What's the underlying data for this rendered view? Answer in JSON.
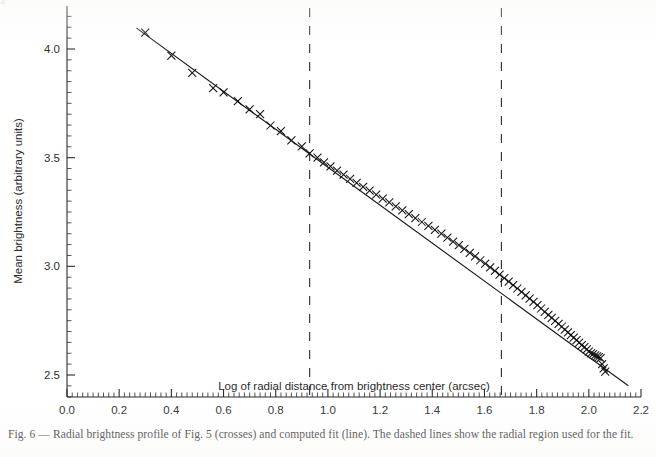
{
  "figure": {
    "clipped_top_text": "3",
    "caption": "Fig. 6 — Radial brightness profile of Fig. 5 (crosses) and computed fit (line). The dashed lines show the radial region used for the fit.",
    "caption_label": "Fig. 6",
    "colors": {
      "ink": "#1a1a1a",
      "axis": "#2b2b2b",
      "marker": "#111111",
      "fit_line": "#1a1a1a",
      "dashed_guide": "#333333",
      "background": "#ffffff"
    }
  },
  "chart_data": {
    "type": "scatter",
    "title": "",
    "xlabel": "Log of radial distance from brightness center (arcsec)",
    "ylabel": "Mean brightness (arbitrary units)",
    "xlim": [
      0.0,
      2.2
    ],
    "ylim": [
      2.4,
      4.15
    ],
    "xticks": [
      0.0,
      0.2,
      0.4,
      0.6,
      0.8,
      1.0,
      1.2,
      1.4,
      1.6,
      1.8,
      2.0,
      2.2
    ],
    "xtick_labels": [
      "0.0",
      "0.2",
      "0.4",
      "0.6",
      "0.8",
      "1.0",
      "1.2",
      "1.4",
      "1.6",
      "1.8",
      "2.0",
      "2.2"
    ],
    "x_minor_step": 0.02,
    "yticks": [
      2.5,
      3.0,
      3.5,
      4.0
    ],
    "ytick_labels": [
      "2.5",
      "3.0",
      "3.5",
      "4.0"
    ],
    "y_minor_step": 0.05,
    "grid": false,
    "legend": "none",
    "series": [
      {
        "name": "Radial brightness profile (crosses)",
        "marker": "x",
        "x": [
          0.3,
          0.4,
          0.48,
          0.56,
          0.6,
          0.655,
          0.7,
          0.74,
          0.78,
          0.82,
          0.86,
          0.9,
          0.93,
          0.96,
          0.985,
          1.01,
          1.035,
          1.06,
          1.085,
          1.11,
          1.135,
          1.16,
          1.185,
          1.21,
          1.235,
          1.26,
          1.285,
          1.31,
          1.335,
          1.36,
          1.385,
          1.41,
          1.435,
          1.458,
          1.48,
          1.502,
          1.523,
          1.544,
          1.564,
          1.584,
          1.603,
          1.622,
          1.64,
          1.658,
          1.676,
          1.693,
          1.71,
          1.726,
          1.742,
          1.758,
          1.773,
          1.788,
          1.803,
          1.817,
          1.831,
          1.845,
          1.858,
          1.871,
          1.884,
          1.896,
          1.908,
          1.92,
          1.931,
          1.942,
          1.953,
          1.963,
          1.973,
          1.983,
          1.992,
          2.0,
          2.008,
          2.016,
          2.024,
          2.031,
          2.038,
          2.045,
          2.051,
          2.057,
          2.063
        ],
        "y": [
          4.075,
          3.97,
          3.89,
          3.82,
          3.8,
          3.76,
          3.722,
          3.7,
          3.648,
          3.622,
          3.58,
          3.552,
          3.52,
          3.5,
          3.478,
          3.46,
          3.44,
          3.422,
          3.402,
          3.384,
          3.366,
          3.348,
          3.33,
          3.312,
          3.294,
          3.276,
          3.258,
          3.24,
          3.222,
          3.204,
          3.186,
          3.168,
          3.15,
          3.132,
          3.114,
          3.098,
          3.08,
          3.062,
          3.046,
          3.028,
          3.012,
          2.995,
          2.979,
          2.962,
          2.946,
          2.93,
          2.914,
          2.898,
          2.882,
          2.866,
          2.851,
          2.836,
          2.821,
          2.806,
          2.791,
          2.777,
          2.763,
          2.749,
          2.735,
          2.722,
          2.709,
          2.696,
          2.684,
          2.672,
          2.66,
          2.649,
          2.638,
          2.628,
          2.618,
          2.608,
          2.6,
          2.596,
          2.59,
          2.586,
          2.582,
          2.578,
          2.55,
          2.53,
          2.515
        ]
      }
    ],
    "fit_line": {
      "name": "Computed fit (line)",
      "style": "solid",
      "x_start": 0.268,
      "y_start": 4.095,
      "x_end": 2.15,
      "y_end": 2.452,
      "slope": -0.873,
      "intercept": 4.329
    },
    "annotations": [
      {
        "name": "fit-region-lower-bound",
        "type": "vline",
        "x": 0.93,
        "style": "dashed"
      },
      {
        "name": "fit-region-upper-bound",
        "type": "vline",
        "x": 1.665,
        "style": "dashed"
      }
    ]
  }
}
